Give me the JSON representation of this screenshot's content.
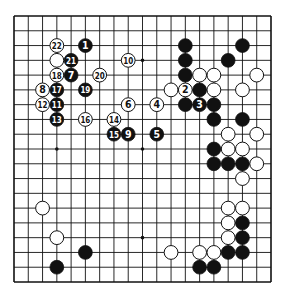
{
  "diagram": {
    "type": "go-board",
    "size": 19,
    "colors": {
      "black": "#111111",
      "white": "#ffffff",
      "line": "#111111",
      "background": "#ffffff"
    },
    "star_points": [
      [
        3,
        3
      ],
      [
        9,
        3
      ],
      [
        15,
        3
      ],
      [
        3,
        9
      ],
      [
        9,
        9
      ],
      [
        15,
        9
      ],
      [
        3,
        15
      ],
      [
        9,
        15
      ],
      [
        15,
        15
      ]
    ],
    "stones": [
      {
        "c": 5,
        "r": 2,
        "color": "black",
        "label": "1"
      },
      {
        "c": 12,
        "r": 5,
        "color": "white",
        "label": "2"
      },
      {
        "c": 13,
        "r": 6,
        "color": "black",
        "label": "3"
      },
      {
        "c": 10,
        "r": 6,
        "color": "white",
        "label": "4"
      },
      {
        "c": 10,
        "r": 8,
        "color": "black",
        "label": "5"
      },
      {
        "c": 8,
        "r": 6,
        "color": "white",
        "label": "6"
      },
      {
        "c": 4,
        "r": 4,
        "color": "black",
        "label": "7"
      },
      {
        "c": 2,
        "r": 5,
        "color": "white",
        "label": "8"
      },
      {
        "c": 8,
        "r": 8,
        "color": "black",
        "label": "9"
      },
      {
        "c": 8,
        "r": 3,
        "color": "white",
        "label": "10"
      },
      {
        "c": 3,
        "r": 6,
        "color": "black",
        "label": "11"
      },
      {
        "c": 2,
        "r": 6,
        "color": "white",
        "label": "12"
      },
      {
        "c": 3,
        "r": 7,
        "color": "black",
        "label": "13"
      },
      {
        "c": 7,
        "r": 7,
        "color": "white",
        "label": "14"
      },
      {
        "c": 7,
        "r": 8,
        "color": "black",
        "label": "15"
      },
      {
        "c": 5,
        "r": 7,
        "color": "white",
        "label": "16"
      },
      {
        "c": 3,
        "r": 5,
        "color": "black",
        "label": "17"
      },
      {
        "c": 3,
        "r": 4,
        "color": "white",
        "label": "18"
      },
      {
        "c": 5,
        "r": 5,
        "color": "black",
        "label": "19"
      },
      {
        "c": 6,
        "r": 4,
        "color": "white",
        "label": "20"
      },
      {
        "c": 4,
        "r": 3,
        "color": "black",
        "label": "21"
      },
      {
        "c": 3,
        "r": 2,
        "color": "white",
        "label": "22"
      },
      {
        "c": 3,
        "r": 3,
        "color": "white",
        "label": ""
      },
      {
        "c": 12,
        "r": 2,
        "color": "black",
        "label": ""
      },
      {
        "c": 16,
        "r": 2,
        "color": "black",
        "label": ""
      },
      {
        "c": 12,
        "r": 3,
        "color": "black",
        "label": ""
      },
      {
        "c": 15,
        "r": 3,
        "color": "black",
        "label": ""
      },
      {
        "c": 12,
        "r": 4,
        "color": "black",
        "label": ""
      },
      {
        "c": 13,
        "r": 4,
        "color": "white",
        "label": ""
      },
      {
        "c": 14,
        "r": 4,
        "color": "white",
        "label": ""
      },
      {
        "c": 17,
        "r": 4,
        "color": "white",
        "label": ""
      },
      {
        "c": 11,
        "r": 5,
        "color": "white",
        "label": ""
      },
      {
        "c": 13,
        "r": 5,
        "color": "black",
        "label": ""
      },
      {
        "c": 14,
        "r": 5,
        "color": "white",
        "label": ""
      },
      {
        "c": 16,
        "r": 5,
        "color": "white",
        "label": ""
      },
      {
        "c": 12,
        "r": 6,
        "color": "black",
        "label": ""
      },
      {
        "c": 14,
        "r": 6,
        "color": "black",
        "label": ""
      },
      {
        "c": 14,
        "r": 7,
        "color": "black",
        "label": ""
      },
      {
        "c": 16,
        "r": 7,
        "color": "black",
        "label": ""
      },
      {
        "c": 15,
        "r": 8,
        "color": "white",
        "label": ""
      },
      {
        "c": 17,
        "r": 8,
        "color": "white",
        "label": ""
      },
      {
        "c": 14,
        "r": 9,
        "color": "black",
        "label": ""
      },
      {
        "c": 15,
        "r": 9,
        "color": "white",
        "label": ""
      },
      {
        "c": 16,
        "r": 9,
        "color": "white",
        "label": ""
      },
      {
        "c": 14,
        "r": 10,
        "color": "black",
        "label": ""
      },
      {
        "c": 15,
        "r": 10,
        "color": "black",
        "label": ""
      },
      {
        "c": 16,
        "r": 10,
        "color": "black",
        "label": ""
      },
      {
        "c": 17,
        "r": 10,
        "color": "white",
        "label": ""
      },
      {
        "c": 16,
        "r": 11,
        "color": "white",
        "label": ""
      },
      {
        "c": 15,
        "r": 13,
        "color": "white",
        "label": ""
      },
      {
        "c": 16,
        "r": 13,
        "color": "white",
        "label": ""
      },
      {
        "c": 15,
        "r": 14,
        "color": "white",
        "label": ""
      },
      {
        "c": 16,
        "r": 14,
        "color": "black",
        "label": ""
      },
      {
        "c": 15,
        "r": 15,
        "color": "white",
        "label": ""
      },
      {
        "c": 16,
        "r": 15,
        "color": "black",
        "label": ""
      },
      {
        "c": 11,
        "r": 16,
        "color": "white",
        "label": ""
      },
      {
        "c": 13,
        "r": 16,
        "color": "white",
        "label": ""
      },
      {
        "c": 14,
        "r": 16,
        "color": "white",
        "label": ""
      },
      {
        "c": 15,
        "r": 16,
        "color": "black",
        "label": ""
      },
      {
        "c": 16,
        "r": 16,
        "color": "black",
        "label": ""
      },
      {
        "c": 13,
        "r": 17,
        "color": "black",
        "label": ""
      },
      {
        "c": 14,
        "r": 17,
        "color": "black",
        "label": ""
      },
      {
        "c": 2,
        "r": 13,
        "color": "white",
        "label": ""
      },
      {
        "c": 3,
        "r": 15,
        "color": "white",
        "label": ""
      },
      {
        "c": 5,
        "r": 16,
        "color": "black",
        "label": ""
      },
      {
        "c": 3,
        "r": 17,
        "color": "black",
        "label": ""
      }
    ]
  }
}
